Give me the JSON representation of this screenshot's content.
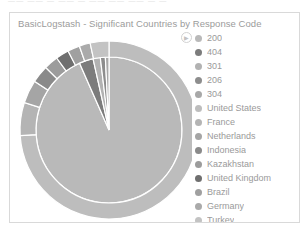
{
  "top_strip": {
    "clipped_text": "——  ——  —  ——  —  ——   ——    ——     — —"
  },
  "panel": {
    "title": "BasicLogstash - Significant Countries by Response Code",
    "background": "#ffffff",
    "border_color": "#d9d9d9"
  },
  "legend": {
    "toggle_icon": "chevron-right-icon",
    "toggle_glyph": "▶",
    "items": [
      {
        "label": "200",
        "color": "#b9b9b9"
      },
      {
        "label": "404",
        "color": "#7c7c7c"
      },
      {
        "label": "301",
        "color": "#b2b2b2"
      },
      {
        "label": "206",
        "color": "#8d8d8d"
      },
      {
        "label": "304",
        "color": "#a8a8a8"
      },
      {
        "label": "United States",
        "color": "#bdbdbd"
      },
      {
        "label": "France",
        "color": "#b4b4b4"
      },
      {
        "label": "Netherlands",
        "color": "#a5a5a5"
      },
      {
        "label": "Indonesia",
        "color": "#8a8a8a"
      },
      {
        "label": "Kazakhstan",
        "color": "#9c9c9c"
      },
      {
        "label": "United Kingdom",
        "color": "#6f6f6f"
      },
      {
        "label": "Brazil",
        "color": "#a0a0a0"
      },
      {
        "label": "Germany",
        "color": "#aaaaaa"
      },
      {
        "label": "Turkey",
        "color": "#c3c3c3"
      }
    ]
  },
  "chart_data": {
    "type": "pie",
    "title": "BasicLogstash - Significant Countries by Response Code",
    "subtitle": "",
    "xlabel": "",
    "ylabel": "",
    "grid": false,
    "legend_position": "right",
    "layout": "nested donut (inner ring = response code, outer ring = country)",
    "center": {
      "x": 99,
      "y": 117
    },
    "inner_radius": 0,
    "ring_boundary_radius": 73,
    "outer_radius": 89,
    "start_angle_deg": -90,
    "slice_stroke": "#ffffff",
    "rings": [
      {
        "name": "Response Code",
        "level": 1,
        "labels": [
          "200",
          "404",
          "301",
          "206",
          "304"
        ],
        "values": [
          93.4,
          3.1,
          1.6,
          1.1,
          0.8
        ],
        "colors": [
          "#b9b9b9",
          "#7c7c7c",
          "#b2b2b2",
          "#8d8d8d",
          "#a8a8a8"
        ]
      },
      {
        "name": "Country",
        "level": 2,
        "labels": [
          "United States",
          "France",
          "Netherlands",
          "Indonesia",
          "Kazakhstan",
          "United Kingdom",
          "Brazil",
          "Germany",
          "Turkey"
        ],
        "values": [
          74.0,
          6.0,
          4.2,
          3.2,
          2.6,
          2.4,
          2.2,
          2.0,
          3.4
        ],
        "colors": [
          "#bdbdbd",
          "#b4b4b4",
          "#a5a5a5",
          "#8a8a8a",
          "#9c9c9c",
          "#6f6f6f",
          "#a0a0a0",
          "#aaaaaa",
          "#c3c3c3"
        ]
      }
    ]
  }
}
